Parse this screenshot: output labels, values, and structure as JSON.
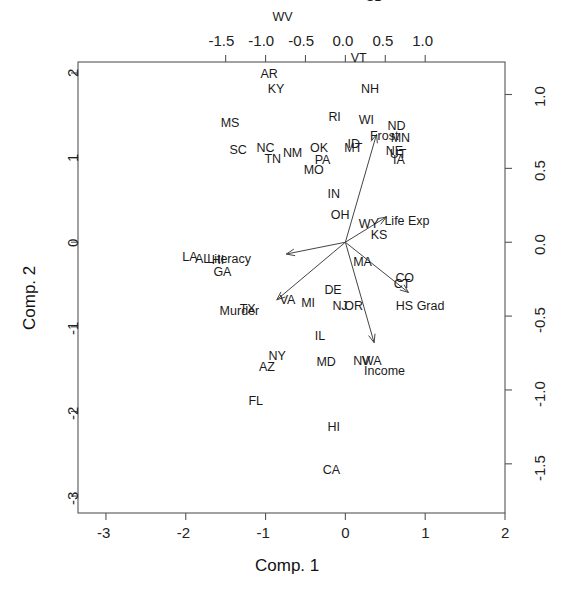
{
  "chart_data": {
    "type": "scatter",
    "subtype": "pca-biplot",
    "title": "",
    "xlabel": "Comp. 1",
    "ylabel": "Comp. 2",
    "bottom_axis": {
      "label": "Comp. 1",
      "ticks": [
        "-3",
        "-2",
        "-1",
        "0",
        "1",
        "2"
      ],
      "values": [
        -3,
        -2,
        -1,
        0,
        1,
        2
      ],
      "lim": [
        -3.35,
        2.0
      ]
    },
    "left_axis": {
      "label": "Comp. 2",
      "ticks": [
        "2",
        "1",
        "0",
        "-1",
        "-2",
        "-3"
      ],
      "values": [
        2,
        1,
        0,
        -1,
        -2,
        -3
      ],
      "lim": [
        -3.2,
        2.13
      ]
    },
    "top_axis": {
      "label": "",
      "ticks": [
        "-1.5",
        "-1.0",
        "-0.5",
        "0.0",
        "0.5",
        "1.0"
      ],
      "values": [
        -1.5,
        -1.0,
        -0.5,
        0.0,
        0.5,
        1.0
      ]
    },
    "right_axis": {
      "label": "",
      "ticks": [
        "1.0",
        "0.5",
        "0.0",
        "-0.5",
        "-1.0",
        "-1.5"
      ],
      "values": [
        1.0,
        0.5,
        0.0,
        -0.5,
        -1.0,
        -1.5
      ]
    },
    "grid": false,
    "legend": "none",
    "points": [
      {
        "label": "ME",
        "x": -0.02,
        "y": 1.78
      },
      {
        "label": "SD",
        "x": 0.35,
        "y": 1.65
      },
      {
        "label": "WV",
        "x": -0.82,
        "y": 1.52
      },
      {
        "label": "VT",
        "x": 0.16,
        "y": 1.24
      },
      {
        "label": "AR",
        "x": -0.97,
        "y": 1.13
      },
      {
        "label": "KY",
        "x": -0.88,
        "y": 1.03
      },
      {
        "label": "NH",
        "x": 0.29,
        "y": 1.03
      },
      {
        "label": "MS",
        "x": -1.47,
        "y": 0.8
      },
      {
        "label": "RI",
        "x": -0.12,
        "y": 0.84
      },
      {
        "label": "WI",
        "x": 0.26,
        "y": 0.82
      },
      {
        "label": "ND",
        "x": 0.62,
        "y": 0.78
      },
      {
        "label": "MN",
        "x": 0.66,
        "y": 0.7
      },
      {
        "label": "SC",
        "x": -1.36,
        "y": 0.62
      },
      {
        "label": "NC",
        "x": -1.02,
        "y": 0.63
      },
      {
        "label": "TN",
        "x": -0.92,
        "y": 0.56
      },
      {
        "label": "NM",
        "x": -0.69,
        "y": 0.6
      },
      {
        "label": "OK",
        "x": -0.35,
        "y": 0.63
      },
      {
        "label": "MT",
        "x": 0.08,
        "y": 0.63
      },
      {
        "label": "ID",
        "x": 0.12,
        "y": 0.66
      },
      {
        "label": "NE",
        "x": 0.6,
        "y": 0.61
      },
      {
        "label": "UT",
        "x": 0.65,
        "y": 0.59
      },
      {
        "label": "IA",
        "x": 0.69,
        "y": 0.55
      },
      {
        "label": "PA",
        "x": -0.29,
        "y": 0.55
      },
      {
        "label": "MO",
        "x": -0.43,
        "y": 0.48
      },
      {
        "label": "IN",
        "x": -0.13,
        "y": 0.32
      },
      {
        "label": "OH",
        "x": -0.09,
        "y": 0.18
      },
      {
        "label": "WY",
        "x": 0.26,
        "y": 0.12
      },
      {
        "label": "KS",
        "x": 0.41,
        "y": 0.04
      },
      {
        "label": "LA",
        "x": -1.95,
        "y": -0.11
      },
      {
        "label": "AL",
        "x": -1.79,
        "y": -0.12
      },
      {
        "label": "HI",
        "x": -1.58,
        "y": -0.13
      },
      {
        "label": "GA",
        "x": -1.56,
        "y": -0.21
      },
      {
        "label": "MA",
        "x": 0.19,
        "y": -0.14
      },
      {
        "label": "CO",
        "x": 0.72,
        "y": -0.25
      },
      {
        "label": "CT",
        "x": 0.7,
        "y": -0.29
      },
      {
        "label": "DE",
        "x": -0.17,
        "y": -0.33
      },
      {
        "label": "TX",
        "x": -1.23,
        "y": -0.46
      },
      {
        "label": "VA",
        "x": -0.73,
        "y": -0.4
      },
      {
        "label": "MI",
        "x": -0.46,
        "y": -0.42
      },
      {
        "label": "NJ",
        "x": -0.07,
        "y": -0.44
      },
      {
        "label": "OR",
        "x": 0.08,
        "y": -0.44
      },
      {
        "label": "IL",
        "x": -0.29,
        "y": -0.64
      },
      {
        "label": "MD",
        "x": -0.27,
        "y": -0.82
      },
      {
        "label": "NV",
        "x": 0.19,
        "y": -0.81
      },
      {
        "label": "WA",
        "x": 0.3,
        "y": -0.81
      },
      {
        "label": "NY",
        "x": -0.87,
        "y": -0.78
      },
      {
        "label": "AZ",
        "x": -0.99,
        "y": -0.85
      },
      {
        "label": "FL",
        "x": -1.12,
        "y": -1.08
      },
      {
        "label": "HI2",
        "x": -0.13,
        "y": -1.26,
        "text": "HI"
      },
      {
        "label": "CA",
        "x": -0.19,
        "y": -1.55
      },
      {
        "label": "AK",
        "x": -0.03,
        "y": -2.44
      }
    ],
    "vectors": [
      {
        "label": "Literacy",
        "tip_x": -0.74,
        "tip_y": -0.08,
        "label_x": -1.39,
        "label_y": -0.12
      },
      {
        "label": "Murder",
        "tip_x": -0.86,
        "tip_y": -0.39,
        "label_x": -1.32,
        "label_y": -0.47
      },
      {
        "label": "Life Exp",
        "tip_x": 0.51,
        "tip_y": 0.17,
        "label_x": 0.83,
        "label_y": 0.14
      },
      {
        "label": "Frost",
        "tip_x": 0.39,
        "tip_y": 0.73,
        "label_x": 0.52,
        "label_y": 0.71
      },
      {
        "label": "HS Grad",
        "tip_x": 0.79,
        "tip_y": -0.34,
        "label_x": 0.93,
        "label_y": -0.44
      },
      {
        "label": "Income",
        "tip_x": 0.36,
        "tip_y": -0.68,
        "label_x": 0.49,
        "label_y": -0.88
      }
    ],
    "origin": {
      "x": 0.0,
      "y": 0.0
    },
    "colors": {
      "points": "#1a1a1a",
      "vectors": "#444444",
      "axis": "#555555",
      "background": "#ffffff"
    }
  }
}
